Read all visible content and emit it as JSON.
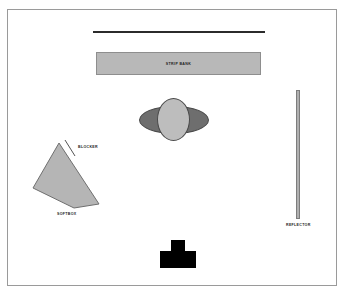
{
  "diagram": {
    "type": "lighting-setup-floorplan",
    "background_color": "#ffffff",
    "frame_color": "#9a9a9a",
    "elements": {
      "backdrop": {
        "name": "backdrop",
        "label": "",
        "color": "#2b2b2b"
      },
      "strip_bank": {
        "name": "strip-bank",
        "label": "STRIP BANK",
        "fill": "#b8b8b8",
        "stroke": "#8e8e8e"
      },
      "subject": {
        "name": "subject",
        "head_fill": "#bdbdbd",
        "body_fill": "#6e6e6e",
        "stroke": "#4a4a4a"
      },
      "softbox": {
        "name": "softbox",
        "label": "SOFTBOX",
        "fill": "#b5b5b5",
        "stroke": "#6f6f6f"
      },
      "blocker": {
        "name": "blocker",
        "label": "BLOCKER",
        "stroke": "#555555"
      },
      "reflector": {
        "name": "reflector",
        "label": "REFLECTOR",
        "fill": "#b0b0b0",
        "stroke": "#7d7d7d"
      },
      "camera": {
        "name": "camera",
        "label": "",
        "fill": "#000000"
      }
    },
    "caption": ""
  }
}
